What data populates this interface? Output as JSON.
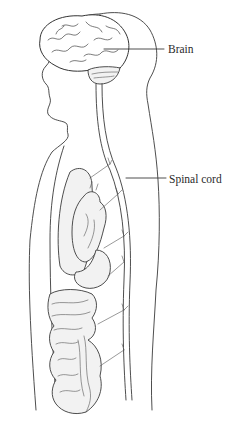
{
  "diagram": {
    "type": "anatomical-illustration",
    "labels": [
      {
        "id": "brain",
        "text": "Brain"
      },
      {
        "id": "spinal_cord",
        "text": "Spinal cord"
      }
    ],
    "structures": [
      "head-profile",
      "brain",
      "cerebellum",
      "spinal-cord",
      "lung",
      "heart",
      "stomach",
      "intestines",
      "nerve-branches"
    ],
    "colors": {
      "line": "#3a3a3a",
      "background": "#ffffff",
      "shading": "#f2f2f2"
    }
  }
}
